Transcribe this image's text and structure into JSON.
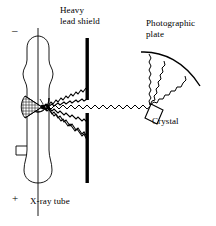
{
  "figure": {
    "background_color": "#ffffff",
    "ink_color": "#000000",
    "width": 216,
    "height": 226
  },
  "labels": {
    "heavy_lead_shield": "Heavy\nlead shield",
    "photographic_plate": "Photographic\nplate",
    "crystal": "Crystal",
    "xray_tube": "X-ray tube",
    "cathode_terminal": "–",
    "anode_terminal": "+"
  },
  "components": {
    "xray_tube": {
      "name": "X-ray tube",
      "terminal_top": "–",
      "terminal_bottom": "+",
      "cathode": "cross-hatched half-disc focusing cup",
      "axis": "vertical centre line"
    },
    "lead_shield": {
      "name": "Heavy lead shield",
      "segments": 2,
      "slit": "central horizontal gap for collimated beam",
      "color": "#000000"
    },
    "crystal": {
      "name": "Crystal",
      "shape": "tilted rectangular block",
      "function": "diffracts incident beam"
    },
    "photographic_plate": {
      "name": "Photographic plate",
      "shape": "curved arc",
      "function": "records diffracted beams"
    }
  },
  "beams": {
    "primary_beam": "horizontal wavy beam from focal spot through shield slit to crystal",
    "blocked_rays": 4,
    "diffracted_beams": 3,
    "style": "zigzag / wavy lines"
  }
}
